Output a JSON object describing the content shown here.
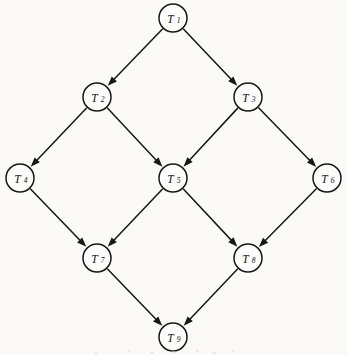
{
  "figure": {
    "type": "directed-acyclic-graph",
    "background_color": "#fbfaf7",
    "stroke_color": "#17171a",
    "node_fill_color": "#fdfdfb",
    "node_radius": 14,
    "width": 347,
    "height": 355
  },
  "nodes": [
    {
      "id": "T1",
      "base": "T",
      "subscript": "1",
      "label": "T1",
      "x": 173,
      "y": 18
    },
    {
      "id": "T2",
      "base": "T",
      "subscript": "2",
      "label": "T2",
      "x": 97,
      "y": 97
    },
    {
      "id": "T3",
      "base": "T",
      "subscript": "3",
      "label": "T3",
      "x": 248,
      "y": 97
    },
    {
      "id": "T4",
      "base": "T",
      "subscript": "4",
      "label": "T4",
      "x": 20,
      "y": 178
    },
    {
      "id": "T5",
      "base": "T",
      "subscript": "5",
      "label": "T5",
      "x": 173,
      "y": 178
    },
    {
      "id": "T6",
      "base": "T",
      "subscript": "6",
      "label": "T6",
      "x": 327,
      "y": 178
    },
    {
      "id": "T7",
      "base": "T",
      "subscript": "7",
      "label": "T7",
      "x": 97,
      "y": 258
    },
    {
      "id": "T8",
      "base": "T",
      "subscript": "8",
      "label": "T8",
      "x": 248,
      "y": 258
    },
    {
      "id": "T9",
      "base": "T",
      "subscript": "9",
      "label": "T9",
      "x": 173,
      "y": 337
    }
  ],
  "edges": [
    {
      "from": "T1",
      "to": "T2",
      "directed": true
    },
    {
      "from": "T1",
      "to": "T3",
      "directed": true
    },
    {
      "from": "T2",
      "to": "T4",
      "directed": true
    },
    {
      "from": "T2",
      "to": "T5",
      "directed": true
    },
    {
      "from": "T3",
      "to": "T5",
      "directed": true
    },
    {
      "from": "T3",
      "to": "T6",
      "directed": true
    },
    {
      "from": "T4",
      "to": "T7",
      "directed": true
    },
    {
      "from": "T5",
      "to": "T7",
      "directed": true
    },
    {
      "from": "T5",
      "to": "T8",
      "directed": true
    },
    {
      "from": "T6",
      "to": "T8",
      "directed": true
    },
    {
      "from": "T7",
      "to": "T9",
      "directed": true
    },
    {
      "from": "T8",
      "to": "T9",
      "directed": true
    }
  ]
}
